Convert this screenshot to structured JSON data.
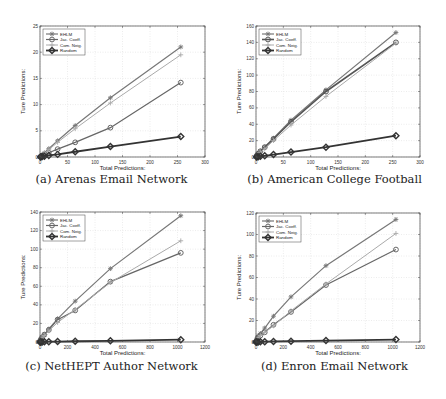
{
  "chart_data": [
    {
      "id": "a",
      "type": "line",
      "caption": "(a) Arenas Email Network",
      "title": "",
      "xlabel": "Total Predictions:",
      "ylabel": "Ture Predictions:",
      "xlim": [
        0,
        300
      ],
      "ylim": [
        0,
        25
      ],
      "xticks": [
        0,
        50,
        100,
        150,
        200,
        250,
        300
      ],
      "yticks": [
        0,
        5,
        10,
        15,
        20,
        25
      ],
      "grid": true,
      "legend_position": "upper left",
      "x": [
        1,
        2,
        4,
        8,
        16,
        32,
        64,
        128,
        256
      ],
      "series": [
        {
          "name": "EHLM",
          "marker": "asterisk",
          "color": "#777777",
          "width": 1.2,
          "values": [
            0.1,
            0.2,
            0.4,
            0.8,
            1.6,
            3.1,
            6.0,
            11.3,
            21.0
          ]
        },
        {
          "name": "Jac. Coeff.",
          "marker": "circle",
          "color": "#666666",
          "width": 1.2,
          "values": [
            0.05,
            0.1,
            0.2,
            0.4,
            0.8,
            1.5,
            2.8,
            5.6,
            14.2
          ]
        },
        {
          "name": "Com. Neig.",
          "marker": "plus",
          "color": "#aaaaaa",
          "width": 1.0,
          "values": [
            0.1,
            0.2,
            0.4,
            0.7,
            1.4,
            2.8,
            5.4,
            10.3,
            19.5
          ]
        },
        {
          "name": "Random",
          "marker": "diamond",
          "color": "#333333",
          "width": 1.8,
          "values": [
            0.02,
            0.04,
            0.1,
            0.15,
            0.3,
            0.5,
            1.0,
            2.0,
            3.9
          ]
        }
      ]
    },
    {
      "id": "b",
      "type": "line",
      "caption": "(b) American College Football",
      "title": "",
      "xlabel": "Total Predictions:",
      "ylabel": "Ture Predictions:",
      "xlim": [
        0,
        300
      ],
      "ylim": [
        0,
        160
      ],
      "xticks": [
        0,
        50,
        100,
        150,
        200,
        250,
        300
      ],
      "yticks": [
        0,
        20,
        40,
        60,
        80,
        100,
        120,
        140,
        160
      ],
      "grid": true,
      "legend_position": "upper left",
      "x": [
        1,
        2,
        4,
        8,
        16,
        32,
        64,
        128,
        256
      ],
      "series": [
        {
          "name": "EHLM",
          "marker": "asterisk",
          "color": "#777777",
          "width": 1.2,
          "values": [
            1,
            2,
            4,
            7,
            12,
            23,
            45,
            82,
            152
          ]
        },
        {
          "name": "Jac. Coeff.",
          "marker": "circle",
          "color": "#555555",
          "width": 1.6,
          "values": [
            1,
            2,
            4,
            7,
            12,
            22,
            43,
            80,
            140
          ]
        },
        {
          "name": "Com. Neig.",
          "marker": "plus",
          "color": "#aaaaaa",
          "width": 1.0,
          "values": [
            1,
            2,
            3,
            6,
            10,
            20,
            39,
            74,
            139
          ]
        },
        {
          "name": "Random",
          "marker": "diamond",
          "color": "#333333",
          "width": 1.8,
          "values": [
            0.1,
            0.2,
            0.4,
            0.8,
            1.5,
            3,
            6,
            12,
            26
          ]
        }
      ]
    },
    {
      "id": "c",
      "type": "line",
      "caption": "(c) NetHEPT Author Network",
      "title": "",
      "xlabel": "Total Predictions:",
      "ylabel": "Ture Predictions:",
      "xlim": [
        0,
        1200
      ],
      "ylim": [
        0,
        140
      ],
      "xticks": [
        0,
        200,
        400,
        600,
        800,
        1000,
        1200
      ],
      "yticks": [
        0,
        20,
        40,
        60,
        80,
        100,
        120,
        140
      ],
      "grid": true,
      "legend_position": "upper left",
      "x": [
        1,
        2,
        4,
        8,
        16,
        32,
        64,
        128,
        256,
        512,
        1024
      ],
      "series": [
        {
          "name": "EHLM",
          "marker": "asterisk",
          "color": "#777777",
          "width": 1.2,
          "values": [
            0.5,
            1,
            2,
            3,
            5,
            8,
            14,
            25,
            44,
            79,
            136
          ]
        },
        {
          "name": "Jac. Coeff.",
          "marker": "circle",
          "color": "#666666",
          "width": 1.2,
          "values": [
            0.5,
            1,
            2,
            3,
            5,
            8,
            13,
            24,
            34,
            65,
            96
          ]
        },
        {
          "name": "Com. Neig.",
          "marker": "plus",
          "color": "#aaaaaa",
          "width": 1.0,
          "values": [
            0.5,
            1,
            1.5,
            3,
            4,
            7,
            12,
            21,
            35,
            64,
            109
          ]
        },
        {
          "name": "Random",
          "marker": "diamond",
          "color": "#333333",
          "width": 1.8,
          "values": [
            0,
            0,
            0,
            0,
            0.1,
            0.2,
            0.3,
            0.5,
            0.8,
            1.3,
            2.5
          ]
        }
      ]
    },
    {
      "id": "d",
      "type": "line",
      "caption": "(d) Enron Email Network",
      "title": "",
      "xlabel": "Total Predictions:",
      "ylabel": "Ture Predictions:",
      "xlim": [
        0,
        1200
      ],
      "ylim": [
        0,
        120
      ],
      "xticks": [
        0,
        200,
        400,
        600,
        800,
        1000,
        1200
      ],
      "yticks": [
        0,
        20,
        40,
        60,
        80,
        100,
        120
      ],
      "grid": true,
      "legend_position": "upper left",
      "x": [
        1,
        2,
        4,
        8,
        16,
        32,
        64,
        128,
        256,
        512,
        1024
      ],
      "series": [
        {
          "name": "EHLM",
          "marker": "asterisk",
          "color": "#777777",
          "width": 1.2,
          "values": [
            0.5,
            1,
            2,
            4,
            6,
            8,
            13,
            24,
            42,
            71,
            114
          ]
        },
        {
          "name": "Jac. Coeff.",
          "marker": "circle",
          "color": "#666666",
          "width": 1.2,
          "values": [
            0.3,
            0.6,
            1,
            2,
            4,
            6,
            9,
            16,
            28,
            53,
            86
          ]
        },
        {
          "name": "Com. Neig.",
          "marker": "plus",
          "color": "#aaaaaa",
          "width": 1.0,
          "values": [
            0.3,
            0.6,
            1,
            2,
            4,
            6,
            9,
            15,
            29,
            54,
            101
          ]
        },
        {
          "name": "Random",
          "marker": "diamond",
          "color": "#333333",
          "width": 1.8,
          "values": [
            0,
            0,
            0,
            0,
            0.1,
            0.2,
            0.3,
            0.5,
            0.8,
            1.3,
            2.3
          ]
        }
      ]
    }
  ],
  "layout": {
    "panels": [
      {
        "left": 0,
        "top": 0,
        "plot": {
          "x0": 40,
          "y0": 26,
          "x1": 205,
          "y1": 157
        },
        "caption_top": 172
      },
      {
        "left": 223,
        "top": 0,
        "plot": {
          "x0": 33,
          "y0": 26,
          "x1": 197,
          "y1": 157
        },
        "caption_top": 172
      },
      {
        "left": 0,
        "top": 200,
        "plot": {
          "x0": 40,
          "y0": 12,
          "x1": 205,
          "y1": 142
        },
        "caption_top": 159
      },
      {
        "left": 223,
        "top": 200,
        "plot": {
          "x0": 33,
          "y0": 13,
          "x1": 197,
          "y1": 142
        },
        "caption_top": 159
      }
    ]
  }
}
